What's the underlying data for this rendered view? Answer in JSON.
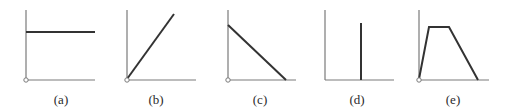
{
  "figure": {
    "panels": [
      {
        "label": "(a)",
        "shape": "constant",
        "axis_x": 26,
        "axis_end": 95,
        "label_x": 61,
        "points": [
          [
            26,
            32
          ],
          [
            95,
            32
          ]
        ]
      },
      {
        "label": "(b)",
        "shape": "linear-increasing",
        "axis_x": 127,
        "axis_end": 196,
        "label_x": 156,
        "points": [
          [
            127,
            79
          ],
          [
            174,
            14
          ]
        ]
      },
      {
        "label": "(c)",
        "shape": "linear-decreasing",
        "axis_x": 228,
        "axis_end": 296,
        "label_x": 260,
        "points": [
          [
            228,
            25
          ],
          [
            286,
            80
          ]
        ]
      },
      {
        "label": "(d)",
        "shape": "impulse",
        "axis_x": 325,
        "axis_end": 394,
        "label_x": 357,
        "points": [
          [
            361,
            23
          ],
          [
            361,
            80
          ]
        ]
      },
      {
        "label": "(e)",
        "shape": "trapezoid",
        "axis_x": 419,
        "axis_end": 489,
        "label_x": 453,
        "points": [
          [
            419,
            79
          ],
          [
            429,
            27
          ],
          [
            449,
            27
          ],
          [
            478,
            80
          ]
        ]
      }
    ],
    "axis_top": 10,
    "axis_bottom": 80,
    "colors": {
      "axis": "#7a7a7a",
      "curve": "#333333",
      "background": "#ffffff"
    }
  }
}
